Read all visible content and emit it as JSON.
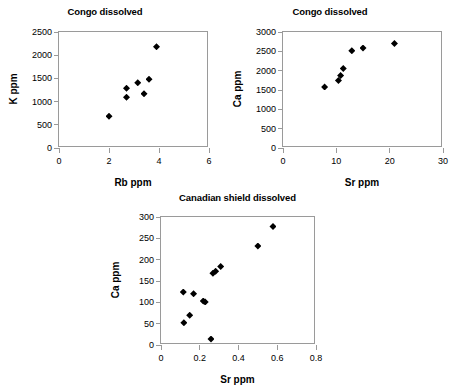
{
  "figure": {
    "width": 453,
    "height": 390,
    "background": "#ffffff",
    "marker_color": "#000000",
    "axis_color": "#9a9a9a",
    "text_color": "#000000"
  },
  "chart_data": [
    {
      "id": "congo-k-rb",
      "type": "scatter",
      "title": "Congo dissolved",
      "xlabel": "Rb ppm",
      "ylabel": "K ppm",
      "xlim": [
        0,
        6
      ],
      "ylim": [
        0,
        2500
      ],
      "xticks": [
        "0",
        "2",
        "4",
        "6"
      ],
      "xtick_values": [
        0,
        2,
        4,
        6
      ],
      "yticks": [
        "0",
        "500",
        "1000",
        "1500",
        "2000",
        "2500"
      ],
      "ytick_values": [
        0,
        500,
        1000,
        1500,
        2000,
        2500
      ],
      "grid": false,
      "legend": "none",
      "marker": "diamond",
      "points": [
        {
          "x": 2.0,
          "y": 685
        },
        {
          "x": 2.7,
          "y": 1290
        },
        {
          "x": 2.7,
          "y": 1095
        },
        {
          "x": 3.15,
          "y": 1405
        },
        {
          "x": 3.4,
          "y": 1170
        },
        {
          "x": 3.6,
          "y": 1480
        },
        {
          "x": 3.9,
          "y": 2180
        }
      ]
    },
    {
      "id": "congo-ca-sr",
      "type": "scatter",
      "title": "Congo dissolved",
      "xlabel": "Sr ppm",
      "ylabel": "Ca ppm",
      "xlim": [
        0,
        30
      ],
      "ylim": [
        0,
        3000
      ],
      "xticks": [
        "0",
        "10",
        "20",
        "30"
      ],
      "xtick_values": [
        0,
        10,
        20,
        30
      ],
      "yticks": [
        "0",
        "500",
        "1000",
        "1500",
        "2000",
        "2500",
        "3000"
      ],
      "ytick_values": [
        0,
        500,
        1000,
        1500,
        2000,
        2500,
        3000
      ],
      "grid": false,
      "legend": "none",
      "marker": "diamond",
      "points": [
        {
          "x": 7.8,
          "y": 1580
        },
        {
          "x": 10.4,
          "y": 1745
        },
        {
          "x": 10.8,
          "y": 1875
        },
        {
          "x": 11.3,
          "y": 2055
        },
        {
          "x": 12.9,
          "y": 2515
        },
        {
          "x": 15.0,
          "y": 2585
        },
        {
          "x": 20.9,
          "y": 2705
        }
      ]
    },
    {
      "id": "canadian-shield-ca-sr",
      "type": "scatter",
      "title": "Canadian shield dissolved",
      "xlabel": "Sr ppm",
      "ylabel": "Ca ppm",
      "xlim": [
        0,
        0.8
      ],
      "ylim": [
        0,
        300
      ],
      "xticks": [
        "0",
        "0.2",
        "0.4",
        "0.6",
        "0.8"
      ],
      "xtick_values": [
        0,
        0.2,
        0.4,
        0.6,
        0.8
      ],
      "yticks": [
        "0",
        "50",
        "100",
        "150",
        "200",
        "250",
        "300"
      ],
      "ytick_values": [
        0,
        50,
        100,
        150,
        200,
        250,
        300
      ],
      "grid": false,
      "legend": "none",
      "marker": "diamond",
      "points": [
        {
          "x": 0.115,
          "y": 124
        },
        {
          "x": 0.118,
          "y": 52
        },
        {
          "x": 0.148,
          "y": 70
        },
        {
          "x": 0.168,
          "y": 120
        },
        {
          "x": 0.218,
          "y": 103
        },
        {
          "x": 0.228,
          "y": 101
        },
        {
          "x": 0.258,
          "y": 14
        },
        {
          "x": 0.268,
          "y": 168
        },
        {
          "x": 0.282,
          "y": 173
        },
        {
          "x": 0.308,
          "y": 184
        },
        {
          "x": 0.5,
          "y": 232
        },
        {
          "x": 0.578,
          "y": 278
        }
      ]
    }
  ],
  "panels": [
    {
      "left": 58,
      "top": 31,
      "width": 150,
      "height": 116,
      "title_top": 6,
      "title_left": 20,
      "title_width": 170,
      "xlabel_dy": 30,
      "ylabel_dx": -45
    },
    {
      "left": 282,
      "top": 31,
      "width": 160,
      "height": 116,
      "title_top": 6,
      "title_left": 245,
      "title_width": 170,
      "xlabel_dy": 30,
      "ylabel_dx": -45
    },
    {
      "left": 160,
      "top": 216,
      "width": 155,
      "height": 128,
      "title_top": 192,
      "title_left": 120,
      "title_width": 235,
      "xlabel_dy": 30,
      "ylabel_dx": -45
    }
  ]
}
